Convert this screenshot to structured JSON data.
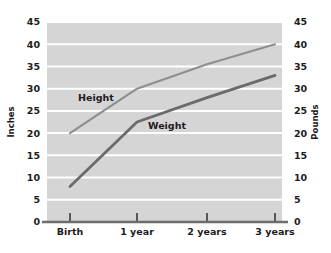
{
  "chart_data": {
    "type": "line",
    "title": "",
    "subtitle": "",
    "categories": [
      "Birth",
      "1 year",
      "2 years",
      "3 years"
    ],
    "x": [
      0,
      1,
      2,
      3
    ],
    "series": [
      {
        "name": "Height",
        "unit": "Inches",
        "axis": "left",
        "color": "#8e8e8e",
        "values": [
          20,
          30,
          35.5,
          40
        ]
      },
      {
        "name": "Weight",
        "unit": "Pounds",
        "axis": "right",
        "color": "#6b6b6b",
        "values": [
          8,
          22.5,
          28,
          33
        ]
      }
    ],
    "xlabel": "",
    "ylabel": "Inches",
    "y2label": "Pounds",
    "ylim": [
      0,
      45
    ],
    "y2lim": [
      0,
      45
    ],
    "yticks": [
      0,
      5,
      10,
      15,
      20,
      25,
      30,
      35,
      40,
      45
    ],
    "y2ticks": [
      0,
      5,
      10,
      15,
      20,
      25,
      30,
      35,
      40,
      45
    ],
    "grid": true,
    "grid_axis": "y",
    "grid_color": "#ffffff",
    "plot_background": "#d5d5d5",
    "legend": "inline-labels",
    "annotations": [
      {
        "text": "Height",
        "series": "Height"
      },
      {
        "text": "Weight",
        "series": "Weight"
      }
    ]
  },
  "axes": {
    "left_title": "Inches",
    "right_title": "Pounds",
    "left_ticks": [
      "45",
      "40",
      "35",
      "30",
      "25",
      "20",
      "15",
      "10",
      "5",
      "0"
    ],
    "right_ticks": [
      "45",
      "40",
      "35",
      "30",
      "25",
      "20",
      "15",
      "10",
      "5",
      "0"
    ],
    "category_labels": [
      "Birth",
      "1 year",
      "2 years",
      "3 years"
    ]
  },
  "series_labels": {
    "height": "Height",
    "weight": "Weight"
  }
}
